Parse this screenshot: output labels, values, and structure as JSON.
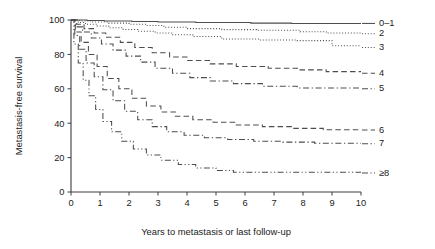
{
  "chart_data": {
    "type": "line",
    "title": "",
    "xlabel": "Years to metastasis or last follow-up",
    "ylabel": "Metastasis-free survival",
    "xlim": [
      0,
      10
    ],
    "ylim": [
      0,
      100
    ],
    "xticks": [
      "0",
      "1",
      "2",
      "3",
      "4",
      "5",
      "6",
      "7",
      "8",
      "9",
      "10"
    ],
    "yticks": [
      "0",
      "20",
      "40",
      "60",
      "80",
      "100"
    ],
    "grid": false,
    "legend_position": "right-outside",
    "line_color": "#4d4d4d",
    "series": [
      {
        "name": "0–1",
        "label": "0–1",
        "dash": "solid",
        "label_y_value": 98,
        "x": [
          0,
          0.55,
          0.55,
          1.15,
          1.15,
          2.1,
          2.1,
          3.0,
          3.0,
          4.3,
          4.3,
          6.2,
          6.2,
          7.6,
          7.6,
          10
        ],
        "y": [
          100,
          100,
          99.7,
          99.7,
          99.4,
          99.4,
          99.1,
          99.1,
          98.8,
          98.8,
          98.5,
          98.5,
          98.2,
          98.2,
          98.0,
          98.0
        ]
      },
      {
        "name": "2",
        "label": "2",
        "dash": "dotted",
        "label_y_value": 92,
        "x": [
          0,
          0.3,
          0.3,
          0.75,
          0.75,
          1.3,
          1.3,
          2.0,
          2.0,
          2.6,
          2.6,
          3.2,
          3.2,
          4.0,
          4.0,
          5.2,
          5.2,
          6.4,
          6.4,
          7.9,
          7.9,
          8.8,
          8.8,
          10
        ],
        "y": [
          100,
          100,
          99.4,
          99.4,
          98.8,
          98.8,
          98.2,
          98.2,
          97.5,
          97.5,
          96.8,
          96.8,
          95.8,
          95.8,
          95.0,
          95.0,
          94.4,
          94.4,
          94.0,
          94.0,
          93.2,
          93.2,
          92.4,
          92.4
        ]
      },
      {
        "name": "3",
        "label": "3",
        "dash": "dotted",
        "label_y_value": 84,
        "x": [
          0,
          0.25,
          0.25,
          0.5,
          0.5,
          0.9,
          0.9,
          1.3,
          1.3,
          1.8,
          1.8,
          2.3,
          2.3,
          2.9,
          2.9,
          3.5,
          3.5,
          4.2,
          4.2,
          5.2,
          5.2,
          6.5,
          6.5,
          7.8,
          7.8,
          9.0,
          9.0,
          10
        ],
        "y": [
          100,
          100,
          98.5,
          98.5,
          97.5,
          97.5,
          96.5,
          96.5,
          95.5,
          95.5,
          94.5,
          94.5,
          93.5,
          93.5,
          92.5,
          92.5,
          91.4,
          91.4,
          90.4,
          90.4,
          89.0,
          89.0,
          88.4,
          88.4,
          88.0,
          88.0,
          85.0,
          85.0
        ]
      },
      {
        "name": "4",
        "label": "4",
        "dash": "dashed",
        "label_y_value": 69,
        "x": [
          0,
          0.2,
          0.2,
          0.45,
          0.45,
          0.8,
          0.8,
          1.2,
          1.2,
          1.7,
          1.7,
          2.2,
          2.2,
          2.8,
          2.8,
          3.4,
          3.4,
          4.0,
          4.0,
          4.8,
          4.8,
          5.7,
          5.7,
          6.8,
          6.8,
          7.8,
          7.8,
          8.8,
          8.8,
          10
        ],
        "y": [
          100,
          100,
          97.5,
          97.5,
          95.0,
          95.0,
          92.5,
          92.5,
          90.0,
          90.0,
          87.0,
          87.0,
          84.0,
          84.0,
          81.0,
          81.0,
          78.5,
          78.5,
          76.5,
          76.5,
          74.5,
          74.5,
          73.0,
          73.0,
          72.0,
          72.0,
          71.0,
          71.0,
          70.0,
          70.0
        ]
      },
      {
        "name": "5",
        "label": "5",
        "dash": "dashdot",
        "label_y_value": 60,
        "x": [
          0,
          0.18,
          0.18,
          0.4,
          0.4,
          0.7,
          0.7,
          1.05,
          1.05,
          1.45,
          1.45,
          1.9,
          1.9,
          2.4,
          2.4,
          2.9,
          2.9,
          3.5,
          3.5,
          4.1,
          4.1,
          4.8,
          4.8,
          5.6,
          5.6,
          6.6,
          6.6,
          7.8,
          7.8,
          10
        ],
        "y": [
          100,
          100,
          96.0,
          96.0,
          93.0,
          93.0,
          89.5,
          89.5,
          86.0,
          86.0,
          82.5,
          82.5,
          79.0,
          79.0,
          75.5,
          75.5,
          72.0,
          72.0,
          69.0,
          69.0,
          66.5,
          66.5,
          64.5,
          64.5,
          63.0,
          63.0,
          61.5,
          61.5,
          60.5,
          60.5
        ]
      },
      {
        "name": "6",
        "label": "6",
        "dash": "dashed",
        "label_y_value": 36,
        "x": [
          0,
          0.15,
          0.15,
          0.35,
          0.35,
          0.6,
          0.6,
          0.9,
          0.9,
          1.25,
          1.25,
          1.65,
          1.65,
          2.1,
          2.1,
          2.6,
          2.6,
          3.1,
          3.1,
          3.6,
          3.6,
          4.2,
          4.2,
          4.9,
          4.9,
          5.7,
          5.7,
          6.6,
          6.6,
          7.6,
          7.6,
          8.7,
          8.7,
          10
        ],
        "y": [
          100,
          100,
          93.0,
          93.0,
          87.0,
          87.0,
          80.0,
          80.0,
          73.0,
          73.0,
          66.0,
          66.0,
          60.0,
          60.0,
          54.5,
          54.5,
          50.0,
          50.0,
          46.5,
          46.5,
          44.0,
          44.0,
          42.0,
          42.0,
          40.5,
          40.5,
          39.0,
          39.0,
          38.0,
          38.0,
          37.0,
          37.0,
          36.2,
          36.2
        ]
      },
      {
        "name": "7",
        "label": "7",
        "dash": "dashdot",
        "label_y_value": 28,
        "x": [
          0,
          0.13,
          0.13,
          0.3,
          0.3,
          0.52,
          0.52,
          0.8,
          0.8,
          1.1,
          1.1,
          1.45,
          1.45,
          1.85,
          1.85,
          2.3,
          2.3,
          2.8,
          2.8,
          3.3,
          3.3,
          3.9,
          3.9,
          4.6,
          4.6,
          5.4,
          5.4,
          6.3,
          6.3,
          7.3,
          7.3,
          8.4,
          8.4,
          10
        ],
        "y": [
          100,
          100,
          91.0,
          91.0,
          83.0,
          83.0,
          75.0,
          75.0,
          67.0,
          67.0,
          59.5,
          59.5,
          53.0,
          53.0,
          47.0,
          47.0,
          42.0,
          42.0,
          38.0,
          38.0,
          35.0,
          35.0,
          33.0,
          33.0,
          31.5,
          31.5,
          30.5,
          30.5,
          29.5,
          29.5,
          29.0,
          29.0,
          28.4,
          28.4
        ]
      },
      {
        "name": "≥8",
        "label": "≥8",
        "dash": "dashdotdot",
        "label_y_value": 11,
        "x": [
          0,
          0.1,
          0.1,
          0.25,
          0.25,
          0.42,
          0.42,
          0.62,
          0.62,
          0.85,
          0.85,
          1.1,
          1.1,
          1.4,
          1.4,
          1.75,
          1.75,
          2.15,
          2.15,
          2.6,
          2.6,
          3.1,
          3.1,
          3.7,
          3.7,
          4.3,
          4.3,
          5.0,
          5.0,
          5.6,
          5.6,
          10
        ],
        "y": [
          100,
          100,
          86.0,
          86.0,
          75.0,
          75.0,
          65.0,
          65.0,
          56.0,
          56.0,
          48.0,
          48.0,
          41.0,
          41.0,
          35.0,
          35.0,
          29.5,
          29.5,
          25.0,
          25.0,
          21.5,
          21.5,
          18.5,
          18.5,
          16.0,
          16.0,
          14.0,
          14.0,
          12.5,
          12.5,
          11.5,
          11.5
        ]
      }
    ]
  }
}
